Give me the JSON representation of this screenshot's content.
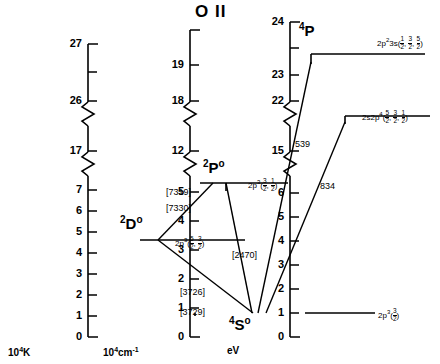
{
  "title": "O II",
  "axes": [
    {
      "name": "10⁴K",
      "unit_base": "10",
      "unit_exp": "4",
      "unit_rest": "K",
      "x": 88,
      "ticks_lower": [
        "0",
        "1",
        "2",
        "3",
        "4",
        "5",
        "6",
        "7"
      ],
      "ticks_upper": [
        "17",
        "26",
        "27"
      ]
    },
    {
      "name": "10⁴cm⁻¹",
      "unit_base": "10",
      "unit_exp": "4",
      "unit_rest": "cm⁻¹",
      "x": 190,
      "ticks_lower": [
        "0",
        "1",
        "2",
        "3",
        "4",
        "5"
      ],
      "ticks_upper": [
        "12",
        "18",
        "19"
      ]
    },
    {
      "name": "eV",
      "unit_base": "",
      "unit_exp": "",
      "unit_rest": "eV",
      "x": 290,
      "ticks_lower": [
        "0",
        "1",
        "2",
        "3",
        "4",
        "5",
        "6"
      ],
      "ticks_upper": [
        "15",
        "22",
        "23",
        "24"
      ]
    }
  ],
  "levels": [
    {
      "id": "ground",
      "term": "4S",
      "term_sup": "4",
      "term_base": "S",
      "term_post": "o",
      "config": "2p³(3/2)",
      "config_base": "2p",
      "config_exp": "3",
      "j_values": [
        "3/2"
      ]
    },
    {
      "id": "2Do",
      "term": "2D",
      "term_sup": "2",
      "term_base": "D",
      "term_post": "o",
      "config": "2p³(5/2, 3/2)",
      "config_base": "2p",
      "config_exp": "3",
      "j_values": [
        "5/2",
        "3/2"
      ]
    },
    {
      "id": "2Po",
      "term": "2P",
      "term_sup": "2",
      "term_base": "P",
      "term_post": "o",
      "config": "2p³(3/2, 1/2)",
      "config_base": "2p",
      "config_exp": "3",
      "j_values": [
        "3/2",
        "1/2"
      ]
    },
    {
      "id": "2s2p4",
      "term": "",
      "term_sup": "",
      "term_base": "",
      "term_post": "",
      "config": "2s2p⁴(5/2, 3/2, 1/2)",
      "config_base": "2s2p",
      "config_exp": "4",
      "j_values": [
        "5/2",
        "3/2",
        "1/2"
      ]
    },
    {
      "id": "4P",
      "term": "4P",
      "term_sup": "4",
      "term_base": "P",
      "term_post": "",
      "config": "2p²3s(1/2, 3/2, 5/2)",
      "config_base": "2p",
      "config_exp": "2",
      "config_mid": "3s",
      "j_values": [
        "1/2",
        "3/2",
        "5/2"
      ]
    }
  ],
  "transitions": [
    {
      "label": "[7319]",
      "forbidden": true,
      "from": "2Po",
      "to": "2Do"
    },
    {
      "label": "[7330]",
      "forbidden": true,
      "from": "2Po",
      "to": "2Do"
    },
    {
      "label": "[3726]",
      "forbidden": true,
      "from": "2Do",
      "to": "ground"
    },
    {
      "label": "[3729]",
      "forbidden": true,
      "from": "2Do",
      "to": "ground"
    },
    {
      "label": "[2470]",
      "forbidden": true,
      "from": "2Po",
      "to": "ground"
    },
    {
      "label": "539",
      "forbidden": false,
      "from": "4P",
      "to": "ground"
    },
    {
      "label": "834",
      "forbidden": false,
      "from": "2s2p4",
      "to": "ground"
    }
  ]
}
